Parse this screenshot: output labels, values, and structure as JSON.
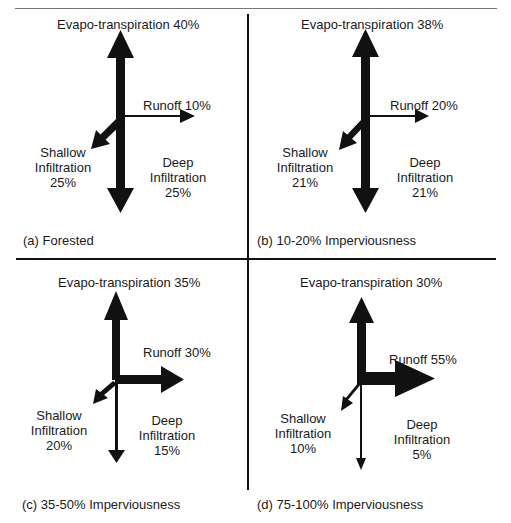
{
  "figure": {
    "panels": [
      {
        "id": "a",
        "caption": "(a)  Forested",
        "evapotranspiration": "Evapo-transpiration 40%",
        "runoff": "Runoff 10%",
        "shallow": [
          "Shallow",
          "Infiltration",
          "25%"
        ],
        "deep": [
          "Deep",
          "Infiltration",
          "25%"
        ]
      },
      {
        "id": "b",
        "caption": "(b)  10-20% Imperviousness",
        "evapotranspiration": "Evapo-transpiration 38%",
        "runoff": "Runoff 20%",
        "shallow": [
          "Shallow",
          "Infiltration",
          "21%"
        ],
        "deep": [
          "Deep",
          "Infiltration",
          "21%"
        ]
      },
      {
        "id": "c",
        "caption": "(c)  35-50% Imperviousness",
        "evapotranspiration": "Evapo-transpiration 35%",
        "runoff": "Runoff 30%",
        "shallow": [
          "Shallow",
          "Infiltration",
          "20%"
        ],
        "deep": [
          "Deep",
          "Infiltration",
          "15%"
        ]
      },
      {
        "id": "d",
        "caption": "(d)  75-100% Imperviousness",
        "evapotranspiration": "Evapo-transpiration 30%",
        "runoff": "Runoff 55%",
        "shallow": [
          "Shallow",
          "Infiltration",
          "10%"
        ],
        "deep": [
          "Deep",
          "Infiltration",
          "5%"
        ]
      }
    ],
    "colors": {
      "arrow": "#111111",
      "text": "#1a1a1a",
      "background": "#ffffff"
    }
  }
}
